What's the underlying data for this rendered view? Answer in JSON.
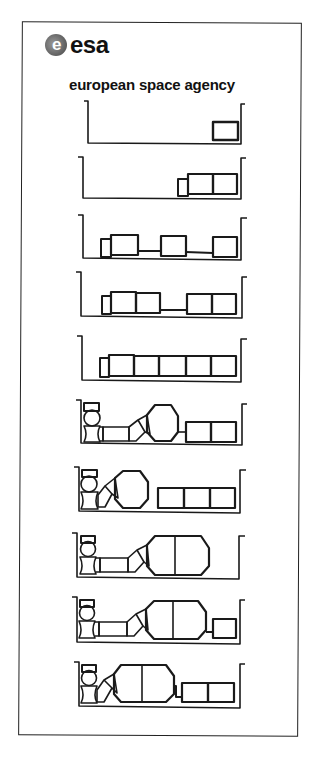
{
  "header": {
    "logo_text": "esa",
    "logo_glyph": "e",
    "subtitle": "european space agency"
  },
  "diagram": {
    "stroke_color": "#1a1a1a",
    "background": "#ffffff",
    "stages": [
      {
        "step": 1,
        "description": "Single module in cargo bay"
      },
      {
        "step": 2,
        "description": "Small node plus two joined modules"
      },
      {
        "step": 3,
        "description": "Node with three spaced modules connected by struts"
      },
      {
        "step": 4,
        "description": "Node with two module pairs connected by strut"
      },
      {
        "step": 5,
        "description": "Node with five joined modules"
      },
      {
        "step": 6,
        "description": "Docking adapter, tunnel, large pressurised module and two modules"
      },
      {
        "step": 7,
        "description": "Docking adapter, large module and three modules"
      },
      {
        "step": 8,
        "description": "Docking adapter, tunnel and large two-segment module"
      },
      {
        "step": 9,
        "description": "Docking adapter, tunnel, large two-segment module and one module"
      },
      {
        "step": 10,
        "description": "Docking adapter, large two-segment module and two modules"
      }
    ]
  }
}
